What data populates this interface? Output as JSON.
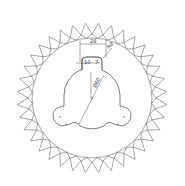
{
  "diagram": {
    "type": "technical-drawing",
    "center": [
      92,
      98
    ],
    "teeth_count": 36,
    "tooth_tip_radius": 75,
    "tooth_base_radius": 64,
    "rim_inner_radius": 60,
    "hub_radius": 28,
    "lobe_count": 3,
    "stroke_color": "#555555",
    "background": "#ffffff"
  },
  "dimensions": {
    "top_width": "28",
    "corner_radius": "R8",
    "left_offset": "10",
    "right_offset": "7",
    "diagonal": "Ø60"
  }
}
